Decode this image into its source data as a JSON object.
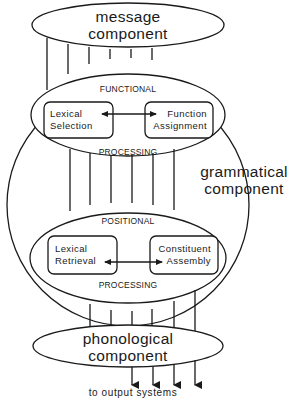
{
  "diagram": {
    "nodes": {
      "message": {
        "line1": "message",
        "line2": "component"
      },
      "grammatical": {
        "line1": "grammatical",
        "line2": "component"
      },
      "functional": {
        "title": "FUNCTIONAL",
        "footer": "PROCESSING",
        "boxes": [
          {
            "line1": "Lexical",
            "line2": "Selection"
          },
          {
            "line1": "Function",
            "line2": "Assignment"
          }
        ]
      },
      "positional": {
        "title": "POSITIONAL",
        "footer": "PROCESSING",
        "boxes": [
          {
            "line1": "Lexical",
            "line2": "Retrieval"
          },
          {
            "line1": "Constituent",
            "line2": "Assembly"
          }
        ]
      },
      "phonological": {
        "line1": "phonological",
        "line2": "component"
      }
    },
    "output_label": "to output systems",
    "colors": {
      "stroke": "#1a1a1a",
      "background": "#ffffff"
    }
  }
}
